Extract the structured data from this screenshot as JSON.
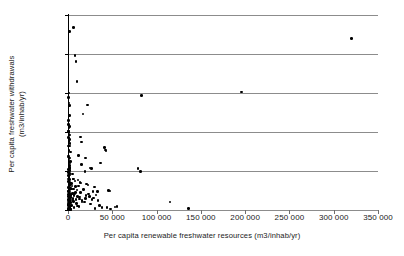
{
  "chart_data": {
    "type": "scatter",
    "title": "",
    "xlabel": "Per capita renewable freshwater resources (m3/inhab/yr)",
    "ylabel_line1": "Per capita freshwater withdrawals",
    "ylabel_line2": "(m3/inhab/yr)",
    "xlim": [
      0,
      350000
    ],
    "ylim": [
      0,
      2500
    ],
    "xticks": [
      0,
      50000,
      100000,
      150000,
      200000,
      250000,
      300000,
      350000
    ],
    "xtick_labels": [
      "0",
      "50 000",
      "100 000",
      "150 000",
      "200 000",
      "250 000",
      "300 000",
      "350 000"
    ],
    "yticks": [
      0,
      500,
      1000,
      1500,
      2000,
      2500
    ],
    "ytick_labels": [
      "0",
      "500",
      "1 000",
      "1 500",
      "2 000",
      "2 500"
    ],
    "grid": "horizontal",
    "legend": "none",
    "marker": "filled-circle",
    "marker_color": "#000000",
    "gridline_color": "#8c8c8c",
    "points": [
      [
        320000,
        2200
      ],
      [
        196000,
        1515
      ],
      [
        83000,
        1470
      ],
      [
        6500,
        2340
      ],
      [
        1500,
        2290
      ],
      [
        8000,
        1980
      ],
      [
        9000,
        1905
      ],
      [
        10000,
        1650
      ],
      [
        900,
        1500
      ],
      [
        600,
        1440
      ],
      [
        1200,
        1370
      ],
      [
        1500,
        1340
      ],
      [
        22000,
        1345
      ],
      [
        17000,
        1230
      ],
      [
        800,
        1095
      ],
      [
        1400,
        1070
      ],
      [
        1000,
        1050
      ],
      [
        600,
        1010
      ],
      [
        1200,
        990
      ],
      [
        2000,
        960
      ],
      [
        14000,
        935
      ],
      [
        1700,
        905
      ],
      [
        15000,
        870
      ],
      [
        900,
        880
      ],
      [
        2200,
        850
      ],
      [
        1500,
        820
      ],
      [
        41000,
        800
      ],
      [
        42500,
        770
      ],
      [
        43000,
        755
      ],
      [
        2500,
        745
      ],
      [
        12000,
        700
      ],
      [
        700,
        690
      ],
      [
        1800,
        665
      ],
      [
        20000,
        665
      ],
      [
        1300,
        640
      ],
      [
        2600,
        625
      ],
      [
        37000,
        600
      ],
      [
        15500,
        580
      ],
      [
        2000,
        570
      ],
      [
        900,
        555
      ],
      [
        1400,
        545
      ],
      [
        25000,
        540
      ],
      [
        26500,
        530
      ],
      [
        79000,
        530
      ],
      [
        600,
        520
      ],
      [
        1100,
        510
      ],
      [
        2100,
        505
      ],
      [
        19000,
        495
      ],
      [
        82000,
        490
      ],
      [
        500,
        480
      ],
      [
        1600,
        470
      ],
      [
        1000,
        460
      ],
      [
        2400,
        450
      ],
      [
        700,
        440
      ],
      [
        1300,
        430
      ],
      [
        900,
        415
      ],
      [
        5500,
        400
      ],
      [
        6500,
        395
      ],
      [
        1800,
        390
      ],
      [
        11500,
        385
      ],
      [
        1200,
        375
      ],
      [
        600,
        365
      ],
      [
        2000,
        355
      ],
      [
        13500,
        350
      ],
      [
        14500,
        345
      ],
      [
        2800,
        340
      ],
      [
        21000,
        335
      ],
      [
        900,
        330
      ],
      [
        22500,
        320
      ],
      [
        1500,
        315
      ],
      [
        4500,
        310
      ],
      [
        8500,
        300
      ],
      [
        30000,
        295
      ],
      [
        1100,
        290
      ],
      [
        700,
        285
      ],
      [
        2300,
        275
      ],
      [
        1400,
        265
      ],
      [
        17500,
        260
      ],
      [
        46000,
        250
      ],
      [
        47500,
        245
      ],
      [
        500,
        240
      ],
      [
        33000,
        235
      ],
      [
        1900,
        230
      ],
      [
        1000,
        225
      ],
      [
        5000,
        215
      ],
      [
        7500,
        210
      ],
      [
        23000,
        205
      ],
      [
        1300,
        200
      ],
      [
        800,
        195
      ],
      [
        2600,
        185
      ],
      [
        1600,
        180
      ],
      [
        10500,
        175
      ],
      [
        600,
        170
      ],
      [
        1200,
        165
      ],
      [
        3200,
        160
      ],
      [
        115000,
        105
      ],
      [
        29000,
        155
      ],
      [
        1800,
        150
      ],
      [
        900,
        145
      ],
      [
        13000,
        140
      ],
      [
        400,
        135
      ],
      [
        2100,
        130
      ],
      [
        34000,
        125
      ],
      [
        1500,
        120
      ],
      [
        700,
        115
      ],
      [
        6000,
        110
      ],
      [
        1100,
        105
      ],
      [
        18500,
        100
      ],
      [
        2400,
        95
      ],
      [
        500,
        90
      ],
      [
        9500,
        85
      ],
      [
        1300,
        80
      ],
      [
        25500,
        75
      ],
      [
        800,
        70
      ],
      [
        1700,
        65
      ],
      [
        4000,
        60
      ],
      [
        600,
        55
      ],
      [
        2000,
        50
      ],
      [
        12500,
        45
      ],
      [
        1000,
        40
      ],
      [
        53000,
        38
      ],
      [
        55500,
        42
      ],
      [
        1400,
        35
      ],
      [
        7000,
        30
      ],
      [
        400,
        28
      ],
      [
        2200,
        25
      ],
      [
        136000,
        20
      ],
      [
        30500,
        18
      ],
      [
        1600,
        15
      ],
      [
        900,
        12
      ],
      [
        3500,
        10
      ],
      [
        1200,
        8
      ],
      [
        48000,
        14
      ],
      [
        700,
        5
      ],
      [
        2800,
        4
      ],
      [
        500,
        3
      ],
      [
        1900,
        22
      ],
      [
        11000,
        52
      ],
      [
        16000,
        118
      ],
      [
        5800,
        148
      ],
      [
        20500,
        188
      ],
      [
        27000,
        138
      ],
      [
        3800,
        268
      ],
      [
        8800,
        228
      ],
      [
        1050,
        608
      ],
      [
        1250,
        760
      ],
      [
        750,
        1150
      ],
      [
        1600,
        1210
      ],
      [
        350,
        820
      ],
      [
        450,
        680
      ],
      [
        950,
        310
      ],
      [
        1350,
        470
      ],
      [
        2050,
        600
      ],
      [
        550,
        930
      ],
      [
        650,
        245
      ],
      [
        1150,
        155
      ],
      [
        1450,
        95
      ],
      [
        350,
        400
      ],
      [
        1750,
        530
      ],
      [
        250,
        1010
      ],
      [
        2500,
        280
      ],
      [
        3000,
        200
      ],
      [
        3600,
        95
      ],
      [
        4200,
        340
      ],
      [
        4800,
        128
      ],
      [
        5200,
        460
      ],
      [
        6200,
        270
      ],
      [
        6800,
        185
      ],
      [
        7800,
        370
      ],
      [
        9200,
        135
      ],
      [
        10200,
        255
      ],
      [
        11800,
        310
      ],
      [
        12800,
        165
      ],
      [
        14200,
        225
      ],
      [
        15800,
        100
      ],
      [
        19500,
        150
      ],
      [
        24000,
        175
      ],
      [
        28000,
        240
      ],
      [
        31500,
        190
      ],
      [
        35500,
        60
      ],
      [
        38500,
        30
      ],
      [
        44000,
        35
      ]
    ]
  }
}
